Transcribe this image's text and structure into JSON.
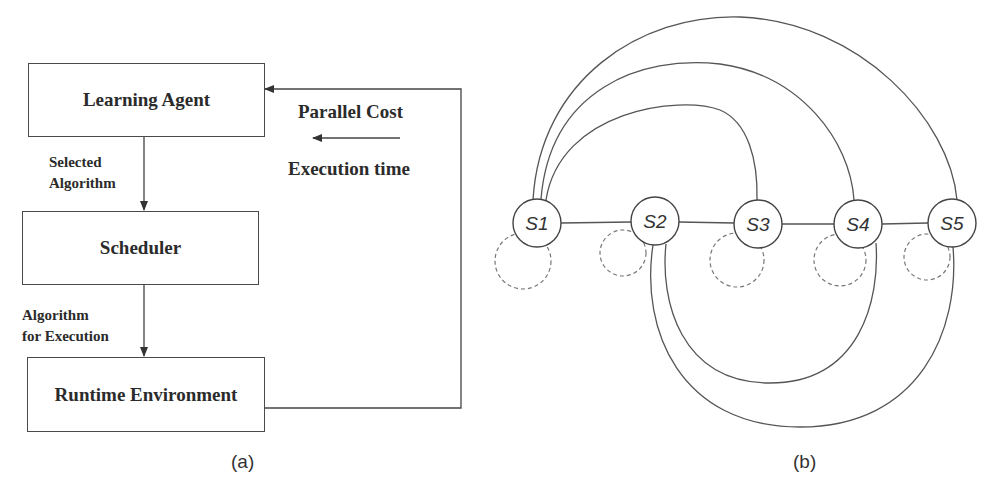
{
  "figure_a": {
    "caption": "(a)",
    "boxes": {
      "learning_agent": "Learning Agent",
      "scheduler": "Scheduler",
      "runtime_environment": "Runtime Environment"
    },
    "edge_labels": {
      "selected_algorithm_line1": "Selected",
      "selected_algorithm_line2": "Algorithm",
      "algorithm_for_execution_line1": "Algorithm",
      "algorithm_for_execution_line2": "for Execution"
    },
    "feedback": {
      "label_top": "Parallel Cost",
      "label_bottom": "Execution time"
    }
  },
  "figure_b": {
    "caption": "(b)",
    "nodes": [
      {
        "id": "S1",
        "prefix": "S",
        "num": "1",
        "cx": 537,
        "cy": 223
      },
      {
        "id": "S2",
        "prefix": "S",
        "num": "2",
        "cx": 655,
        "cy": 221
      },
      {
        "id": "S3",
        "prefix": "S",
        "num": "3",
        "cx": 758,
        "cy": 224
      },
      {
        "id": "S4",
        "prefix": "S",
        "num": "4",
        "cx": 858,
        "cy": 224
      },
      {
        "id": "S5",
        "prefix": "S",
        "num": "5",
        "cx": 952,
        "cy": 223
      }
    ],
    "chain_edges": [
      [
        "S1",
        "S2"
      ],
      [
        "S2",
        "S3"
      ],
      [
        "S3",
        "S4"
      ],
      [
        "S4",
        "S5"
      ]
    ],
    "upper_arcs": [
      [
        "S1",
        "S3"
      ],
      [
        "S1",
        "S4"
      ],
      [
        "S1",
        "S5"
      ]
    ],
    "lower_arcs": [
      [
        "S2",
        "S4"
      ],
      [
        "S2",
        "S5"
      ]
    ],
    "self_loops_dashed": [
      "S1",
      "S2",
      "S3",
      "S4",
      "S5"
    ],
    "colors": {
      "stroke": "#555555",
      "dashed": "#777777"
    }
  }
}
